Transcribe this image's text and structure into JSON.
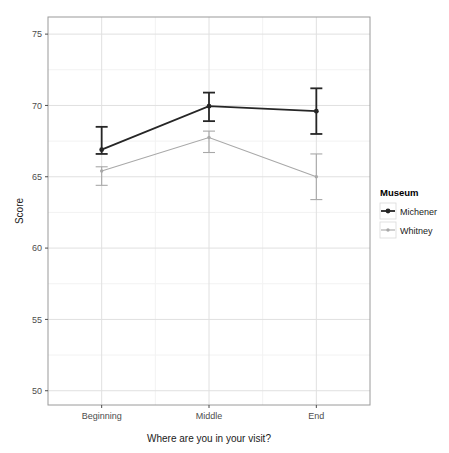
{
  "chart_data": {
    "type": "line",
    "title": "",
    "subtitle": "",
    "xlabel": "Where are you in your visit?",
    "ylabel": "Score",
    "categories": [
      "Beginning",
      "Middle",
      "End"
    ],
    "ylim": [
      49.0,
      76.2
    ],
    "yticks": [
      50,
      55,
      60,
      65,
      70,
      75
    ],
    "ytick_labels": [
      "50",
      "55",
      "60",
      "65",
      "70",
      "75"
    ],
    "grid": true,
    "grid_major_color": "#e0e0e0",
    "grid_minor_color": "#f2f2f2",
    "panel_background": "#ffffff",
    "panel_border_color": "#9a9a9a",
    "legend_position": "right",
    "legend_title": "Museum",
    "error_bars": "shown",
    "series": [
      {
        "name": "Michener",
        "color": "#262626",
        "marker": "point",
        "values": [
          66.9,
          69.95,
          69.6
        ],
        "err_low": [
          66.6,
          68.9,
          68.0
        ],
        "err_high": [
          68.5,
          70.9,
          71.2
        ]
      },
      {
        "name": "Whitney",
        "color": "#a8a8a8",
        "marker": "point",
        "values": [
          65.4,
          67.75,
          65.0
        ],
        "err_low": [
          64.4,
          66.7,
          63.4
        ],
        "err_high": [
          65.7,
          68.2,
          66.6
        ]
      }
    ]
  },
  "legend": {
    "title": "Museum",
    "entries": [
      {
        "label": "Michener",
        "color": "#262626"
      },
      {
        "label": "Whitney",
        "color": "#a8a8a8"
      }
    ]
  },
  "axes": {
    "y_title": "Score",
    "x_title": "Where are you in your visit?",
    "y_tick_labels": [
      "75",
      "70",
      "65",
      "60",
      "55",
      "50"
    ],
    "x_tick_labels": [
      "Beginning",
      "Middle",
      "End"
    ]
  }
}
